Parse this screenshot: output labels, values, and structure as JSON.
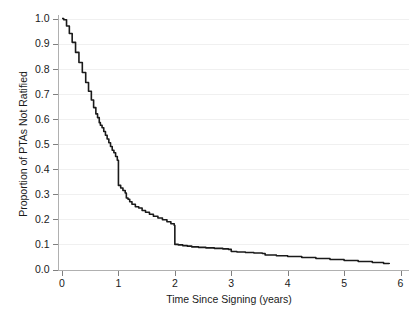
{
  "chart_data": {
    "type": "line",
    "title": "",
    "subtitle": "",
    "xlabel": "Time Since Signing (years)",
    "ylabel": "Proportion of PTAs Not Ratified",
    "xlim": [
      -0.08,
      6.0
    ],
    "ylim": [
      0.0,
      1.0
    ],
    "xticks": [
      0,
      1,
      2,
      3,
      4,
      5,
      6
    ],
    "xtick_labels": [
      "0",
      "1",
      "2",
      "3",
      "4",
      "5",
      "6"
    ],
    "yticks": [
      0.0,
      0.1,
      0.2,
      0.3,
      0.4,
      0.5,
      0.6,
      0.7,
      0.8,
      0.9,
      1.0
    ],
    "ytick_labels": [
      "0.0",
      "0.1",
      "0.2",
      "0.3",
      "0.4",
      "0.5",
      "0.6",
      "0.7",
      "0.8",
      "0.9",
      "1.0"
    ],
    "grid": "horizontal",
    "legend": "none",
    "line_color": "#1a1a1a",
    "grid_color": "#f0f0f0",
    "axis_color": "#b0b0b0",
    "background_color": "#ffffff",
    "series": [
      {
        "name": "Proportion of PTAs Not Ratified",
        "step": "post",
        "x": [
          0.0,
          0.03,
          0.08,
          0.13,
          0.18,
          0.24,
          0.3,
          0.36,
          0.42,
          0.47,
          0.52,
          0.56,
          0.6,
          0.63,
          0.66,
          0.68,
          0.71,
          0.74,
          0.77,
          0.8,
          0.83,
          0.86,
          0.89,
          0.92,
          0.95,
          0.98,
          1.0,
          1.0,
          1.04,
          1.08,
          1.12,
          1.14,
          1.17,
          1.2,
          1.24,
          1.3,
          1.36,
          1.42,
          1.48,
          1.55,
          1.62,
          1.7,
          1.78,
          1.86,
          1.93,
          1.99,
          2.0,
          2.0,
          2.06,
          2.14,
          2.22,
          2.3,
          2.42,
          2.55,
          2.7,
          2.85,
          2.95,
          3.0,
          3.1,
          3.25,
          3.4,
          3.55,
          3.6,
          3.8,
          4.0,
          4.25,
          4.5,
          4.75,
          5.0,
          5.25,
          5.5,
          5.7,
          5.8
        ],
        "y": [
          1.0,
          0.995,
          0.97,
          0.94,
          0.905,
          0.865,
          0.825,
          0.785,
          0.745,
          0.71,
          0.675,
          0.645,
          0.62,
          0.605,
          0.585,
          0.575,
          0.565,
          0.55,
          0.535,
          0.52,
          0.505,
          0.49,
          0.475,
          0.465,
          0.45,
          0.435,
          0.42,
          0.335,
          0.325,
          0.315,
          0.305,
          0.285,
          0.28,
          0.27,
          0.26,
          0.25,
          0.245,
          0.235,
          0.228,
          0.22,
          0.212,
          0.205,
          0.198,
          0.19,
          0.182,
          0.175,
          0.17,
          0.1,
          0.098,
          0.095,
          0.093,
          0.09,
          0.088,
          0.086,
          0.084,
          0.082,
          0.08,
          0.072,
          0.07,
          0.068,
          0.066,
          0.064,
          0.058,
          0.055,
          0.052,
          0.048,
          0.044,
          0.04,
          0.036,
          0.032,
          0.028,
          0.024,
          0.022
        ]
      }
    ],
    "annotations": [
      {
        "label": "sharp drop at 1 year",
        "x": 1.0,
        "y_from": 0.42,
        "y_to": 0.335
      },
      {
        "label": "sharp drop at 2 years",
        "x": 2.0,
        "y_from": 0.17,
        "y_to": 0.1
      }
    ]
  }
}
